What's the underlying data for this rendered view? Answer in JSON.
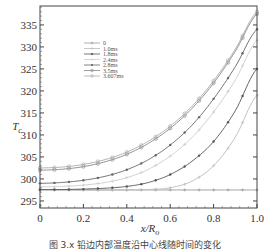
{
  "chart_data": {
    "type": "line",
    "title": "",
    "xlabel": "x/R",
    "xlabel_sub": "o",
    "ylabel": "T",
    "ylabel_sub": "c",
    "xlim": [
      0,
      1.0
    ],
    "ylim": [
      293.4,
      339.3
    ],
    "xticks": [
      0,
      0.2,
      0.4,
      0.6,
      0.8,
      1.0
    ],
    "xtick_labels": [
      "0",
      "0.2",
      "0.4",
      "0.6",
      "0.8",
      "1.0"
    ],
    "yticks": [
      295,
      300,
      305,
      310,
      315,
      320,
      325,
      330,
      335
    ],
    "ytick_labels": [
      "295",
      "300",
      "305",
      "310",
      "315",
      "320",
      "325",
      "330",
      "335"
    ],
    "grid": false,
    "legend_position": "upper-left-inside",
    "x": [
      0.0,
      0.1,
      0.2,
      0.3,
      0.4,
      0.5,
      0.6,
      0.7,
      0.8,
      0.9,
      1.0
    ],
    "series": [
      {
        "name": "0",
        "color": "#999999",
        "marker": "+",
        "values": [
          297.5,
          297.5,
          297.5,
          297.5,
          297.5,
          297.5,
          297.5,
          297.5,
          297.5,
          297.5,
          297.5
        ]
      },
      {
        "name": "1.0ms",
        "color": "#bbbbbb",
        "marker": "+",
        "values": [
          297.5,
          297.5,
          297.5,
          297.5,
          297.5,
          297.6,
          298.0,
          299.5,
          303.0,
          309.5,
          319.0
        ]
      },
      {
        "name": "1.8ms",
        "color": "#555555",
        "marker": "•",
        "values": [
          297.6,
          297.6,
          297.7,
          297.9,
          298.3,
          299.2,
          301.0,
          304.0,
          308.5,
          315.5,
          325.0
        ]
      },
      {
        "name": "2.4ms",
        "color": "#cccccc",
        "marker": "+",
        "values": [
          298.2,
          298.3,
          298.6,
          299.2,
          300.3,
          302.2,
          305.2,
          309.4,
          315.2,
          322.5,
          331.5
        ]
      },
      {
        "name": "2.8ms",
        "color": "#666666",
        "marker": "•",
        "values": [
          299.0,
          299.2,
          299.7,
          300.6,
          302.1,
          304.4,
          307.7,
          312.2,
          318.2,
          325.5,
          334.0
        ]
      },
      {
        "name": "3.5ms",
        "color": "#888888",
        "marker": "◦",
        "values": [
          302.0,
          302.2,
          302.8,
          303.9,
          305.6,
          308.1,
          311.5,
          316.0,
          321.8,
          329.0,
          337.5
        ]
      },
      {
        "name": "3.607ms",
        "color": "#aaaaaa",
        "marker": "◦",
        "values": [
          302.5,
          302.7,
          303.3,
          304.4,
          306.1,
          308.6,
          312.0,
          316.5,
          322.3,
          329.5,
          338.0
        ]
      }
    ]
  },
  "caption": "图 3.x  铅边内部温度沿中心线随时间的变化"
}
